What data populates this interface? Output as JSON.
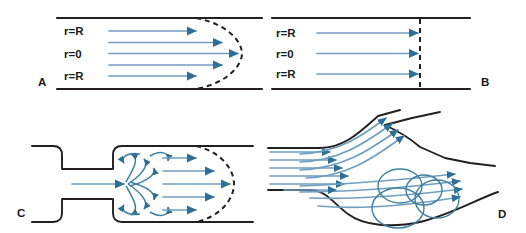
{
  "figure": {
    "width": 526,
    "height": 233,
    "background": "#ffffff",
    "colors": {
      "wall": "#231f20",
      "streamline": "#6f9fc0",
      "streamline_dark": "#2d6f96",
      "arrowhead": "#2d6f96",
      "eddy": "#3b7ea3",
      "dashed_profile": "#231f20",
      "label_text": "#1a1a1a"
    }
  },
  "panels": [
    {
      "id": "A",
      "letter": "A",
      "name": "laminar-parabolic-flow",
      "description": "Laminar flow in a straight tube with parabolic velocity profile",
      "profile_type": "parabolic",
      "arrow_count": 5,
      "labels": [
        {
          "text": "r=R",
          "position": "top-wall"
        },
        {
          "text": "r=0",
          "position": "center-axis"
        },
        {
          "text": "r=R",
          "position": "bottom-wall"
        }
      ],
      "profile_outline": "dashed-parabola"
    },
    {
      "id": "B",
      "letter": "B",
      "name": "plug-flat-flow",
      "description": "Plug flow in a straight tube with flat (blunt) velocity profile",
      "profile_type": "flat",
      "arrow_count": 3,
      "labels": [
        {
          "text": "r=R",
          "position": "top-wall"
        },
        {
          "text": "r=0",
          "position": "center-axis"
        },
        {
          "text": "r=R",
          "position": "bottom-wall"
        }
      ],
      "profile_outline": "dashed-vertical-line"
    },
    {
      "id": "C",
      "letter": "C",
      "name": "stenosis-jet-with-eddies",
      "description": "Flow through a stenosis: jet emerging into expansion with recirculating eddies and re-forming parabolic profile",
      "profile_type": "jet-with-recirculation",
      "arrow_count": 5,
      "labels": [],
      "profile_outline": "dashed-parabola"
    },
    {
      "id": "D",
      "letter": "D",
      "name": "bifurcation-flow-separation",
      "description": "Flow at a vessel bifurcation showing flow separation and vortices in the carotid sinus bulb",
      "profile_type": "branching-with-vortices",
      "arrow_count": 14,
      "vortex_count": 4,
      "labels": [],
      "profile_outline": "none"
    }
  ]
}
